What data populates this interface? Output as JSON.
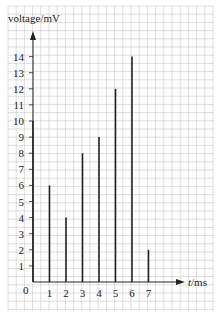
{
  "chart_data": {
    "type": "bar",
    "title": "",
    "xlabel": "t/ms",
    "ylabel": "voltage/mV",
    "x": [
      0,
      1,
      2,
      3,
      4,
      5,
      6,
      7
    ],
    "values": [
      10,
      6,
      4,
      8,
      9,
      12,
      14,
      2
    ],
    "xticks": [
      "0",
      "1",
      "2",
      "3",
      "4",
      "5",
      "6",
      "7"
    ],
    "yticks": [
      "1",
      "2",
      "3",
      "4",
      "5",
      "6",
      "7",
      "8",
      "9",
      "10",
      "11",
      "12",
      "13",
      "14"
    ],
    "xlim": [
      0,
      8
    ],
    "ylim": [
      0,
      15
    ],
    "grid": true,
    "bar_style": "thin vertical lines",
    "legend": null
  },
  "labels": {
    "ylabel": "voltage/mV",
    "xlabel_italic": "t",
    "xlabel_unit": "/ms",
    "origin": "0"
  },
  "colors": {
    "grid": "#c8c8c8",
    "axis": "#222222",
    "bars": "#222222",
    "background": "#ffffff"
  }
}
